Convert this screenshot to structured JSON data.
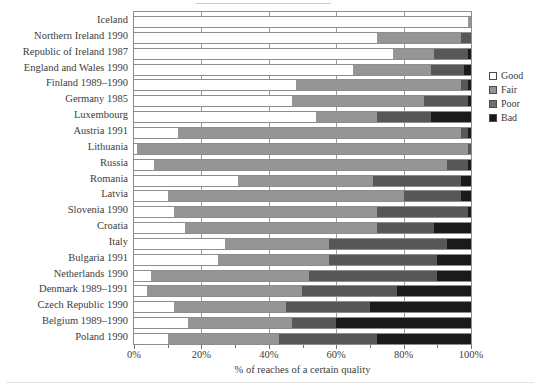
{
  "chart_data": {
    "type": "bar",
    "title": "",
    "subtitle": "",
    "orientation": "horizontal",
    "stacked": true,
    "normalized_percent": true,
    "xlabel": "% of reaches of a certain quality",
    "ylabel": "",
    "xlim": [
      0,
      100
    ],
    "xticks": [
      0,
      20,
      40,
      60,
      80,
      100
    ],
    "xticklabels": [
      "0%",
      "20%",
      "40%",
      "60%",
      "80%",
      "100%"
    ],
    "grid": true,
    "legend_position": "outside-right-top",
    "legend": [
      "Good",
      "Fair",
      "Poor",
      "Bad"
    ],
    "colors": {
      "Good": "#ffffff",
      "Fair": "#959595",
      "Poor": "#575757",
      "Bad": "#1a1a1a"
    },
    "categories": [
      "Iceland",
      "Northern Ireland 1990",
      "Republic of Ireland 1987",
      "England and Wales 1990",
      "Finland 1989–1990",
      "Germany 1985",
      "Luxembourg",
      "Austria 1991",
      "Lithuania",
      "Russia",
      "Romania",
      "Latvia",
      "Slovenia 1990",
      "Croatia",
      "Italy",
      "Bulgaria 1991",
      "Netherlands 1990",
      "Denmark 1989–1991",
      "Czech Republic 1990",
      "Belgium 1989–1990",
      "Poland 1990"
    ],
    "series": [
      {
        "name": "Good",
        "values": [
          99,
          72,
          77,
          65,
          48,
          47,
          54,
          13,
          1,
          6,
          31,
          10,
          12,
          15,
          27,
          25,
          5,
          4,
          12,
          16,
          10
        ]
      },
      {
        "name": "Fair",
        "values": [
          1,
          25,
          12,
          23,
          49,
          39,
          18,
          84,
          98,
          87,
          40,
          70,
          60,
          57,
          31,
          33,
          47,
          46,
          33,
          31,
          33
        ]
      },
      {
        "name": "Poor",
        "values": [
          0,
          3,
          10,
          10,
          2,
          13,
          16,
          2,
          1,
          6,
          26,
          17,
          27,
          17,
          35,
          32,
          38,
          28,
          25,
          13,
          29
        ]
      },
      {
        "name": "Bad",
        "values": [
          0,
          0,
          1,
          2,
          1,
          1,
          12,
          1,
          0,
          1,
          3,
          3,
          1,
          11,
          7,
          10,
          10,
          22,
          30,
          40,
          28
        ]
      }
    ]
  },
  "axis": {
    "xlabel": "% of reaches of a certain quality"
  },
  "legend": {
    "items": [
      {
        "label": "Good",
        "key": "good"
      },
      {
        "label": "Fair",
        "key": "fair"
      },
      {
        "label": "Poor",
        "key": "poor"
      },
      {
        "label": "Bad",
        "key": "bad"
      }
    ]
  }
}
